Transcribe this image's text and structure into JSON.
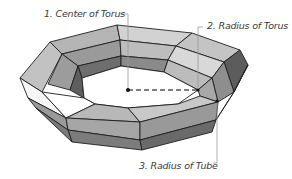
{
  "diagram": {
    "labels": [
      {
        "id": "center",
        "text": "1. Center of Torus"
      },
      {
        "id": "torus_radius",
        "text": "2. Radius of Torus"
      },
      {
        "id": "tube_radius",
        "text": "3. Radius of Tube"
      }
    ],
    "colors": {
      "background": "#ffffff",
      "edge": "#1e1e1e",
      "leader_line": "#9a9a9a",
      "dashed_line": "#555555",
      "face_light": "#d4d4d4",
      "face_mid": "#a9a9a9",
      "face_dark": "#7a7a7a",
      "face_darkest": "#5a5a5a",
      "face_white": "#ffffff"
    }
  }
}
